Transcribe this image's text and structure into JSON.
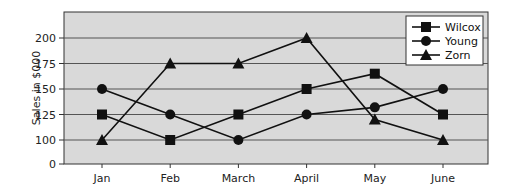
{
  "chart_data": {
    "type": "line",
    "title": "",
    "xlabel": "",
    "ylabel": "Sales in $000",
    "categories": [
      "Jan",
      "Feb",
      "March",
      "April",
      "May",
      "June"
    ],
    "y_ticks": [
      0,
      100,
      125,
      150,
      175,
      200
    ],
    "y_axis_break": "scale jumps from 0 to 100",
    "ylim": [
      0,
      225
    ],
    "grid": true,
    "legend_position": "upper right",
    "series": [
      {
        "name": "Wilcox",
        "marker": "square",
        "values": [
          125,
          100,
          125,
          150,
          165,
          125
        ]
      },
      {
        "name": "Young",
        "marker": "circle",
        "values": [
          150,
          125,
          100,
          125,
          132,
          150
        ]
      },
      {
        "name": "Zorn",
        "marker": "triangle",
        "values": [
          100,
          175,
          175,
          200,
          120,
          100
        ]
      }
    ]
  },
  "colors": {
    "plot_background": "#d9d9d9",
    "gridline": "#555555",
    "series_line": "#111111"
  }
}
